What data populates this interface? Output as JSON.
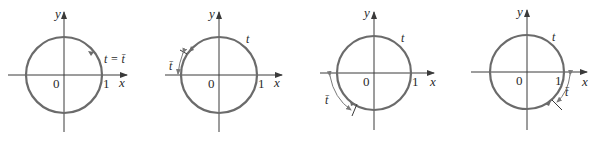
{
  "figure": {
    "panels": [
      {
        "id": "panel-1",
        "axis_x_label": "x",
        "axis_y_label": "y",
        "origin_label": "0",
        "one_label": "1",
        "t_label": "t = t̄",
        "description": "Terminal point in quadrant I; reference number equals t"
      },
      {
        "id": "panel-2",
        "axis_x_label": "x",
        "axis_y_label": "y",
        "origin_label": "0",
        "one_label": "1",
        "t_label": "t",
        "ref_label": "t̄",
        "description": "Terminal point in quadrant II"
      },
      {
        "id": "panel-3",
        "axis_x_label": "x",
        "axis_y_label": "y",
        "origin_label": "0",
        "one_label": "1",
        "t_label": "t",
        "ref_label": "t̄",
        "description": "Terminal point in quadrant III"
      },
      {
        "id": "panel-4",
        "axis_x_label": "x",
        "axis_y_label": "y",
        "origin_label": "0",
        "one_label": "1",
        "t_label": "t",
        "ref_label": "t̄",
        "description": "Terminal point in quadrant IV"
      }
    ],
    "colors": {
      "circle": "#6b6b6b",
      "axes": "#3a3a3a",
      "text": "#2a2a2a"
    }
  }
}
